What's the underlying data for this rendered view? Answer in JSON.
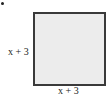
{
  "diagram": {
    "shape": "square",
    "fill_color": "#ececec",
    "border_color": "#3a3a3a",
    "side_label_left": "x + 3",
    "side_label_bottom": "x + 3",
    "bullet": "•"
  }
}
